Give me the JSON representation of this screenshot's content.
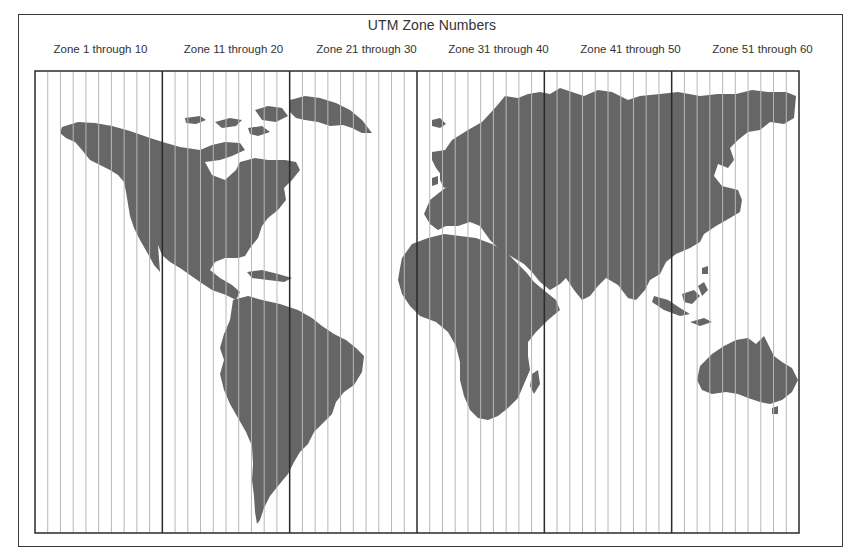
{
  "title": "UTM Zone Numbers",
  "zone_groups": [
    {
      "label": "Zone 1 through 10",
      "first_zone": 1,
      "last_zone": 10
    },
    {
      "label": "Zone 11 through 20",
      "first_zone": 11,
      "last_zone": 20
    },
    {
      "label": "Zone 21 through 30",
      "first_zone": 21,
      "last_zone": 30
    },
    {
      "label": "Zone 31 through 40",
      "first_zone": 31,
      "last_zone": 40
    },
    {
      "label": "Zone 41 through 50",
      "first_zone": 41,
      "last_zone": 50
    },
    {
      "label": "Zone 51 through 60",
      "first_zone": 51,
      "last_zone": 60
    }
  ],
  "zone_count": 60,
  "colors": {
    "land": "#666666",
    "frame": "#3a3a3a",
    "major_line": "#2a2a2a",
    "minor_line": "#b8b8b8",
    "text": "#333333"
  }
}
